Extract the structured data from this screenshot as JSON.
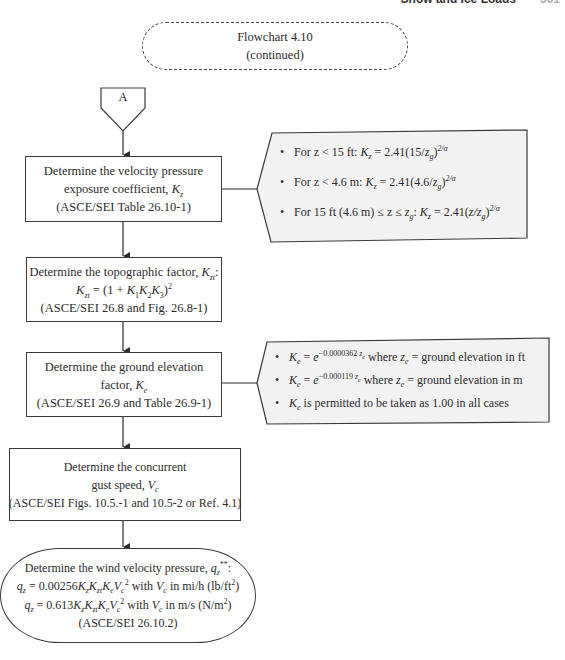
{
  "page_header": {
    "title": "Snow and Ice Loads",
    "page": "301"
  },
  "title_box": {
    "line1": "Flowchart 4.10",
    "line2": "(continued)"
  },
  "connector": {
    "label": "A"
  },
  "steps": [
    {
      "line1": "Determine the velocity pressure",
      "line2_prefix": "exposure coefficient, ",
      "line2_sym": "K",
      "line2_sub": "z",
      "line3": "(ASCE/SEI Table 26.10-1)"
    },
    {
      "line1_prefix": "Determine the topographic factor, ",
      "line1_sym": "K",
      "line1_sub": "zt",
      "line1_suffix": ":",
      "formula": "K_zt = (1 + K_1 K_2 K_3)^2",
      "line3": "(ASCE/SEI 26.8 and Fig. 26.8-1)"
    },
    {
      "line1": "Determine the ground elevation",
      "line2_prefix": "factor, ",
      "line2_sym": "K",
      "line2_sub": "e",
      "line3": "(ASCE/SEI 26.9 and Table 26.9-1)"
    },
    {
      "line1": "Determine the concurrent",
      "line2_prefix": "gust speed, ",
      "line2_sym": "V",
      "line2_sub": "c",
      "line3": "(ASCE/SEI Figs. 10.5.-1 and 10.5-2 or Ref. 4.1)"
    }
  ],
  "terminal": {
    "line1_prefix": "Determine the wind velocity pressure, ",
    "line1_sym": "q",
    "line1_sub": "z",
    "line1_sup": "**",
    "line1_suffix": ":",
    "formula_us": "q_z = 0.00256 K_z K_zt K_e V_c^2 with V_c in mi/h (lb/ft^2)",
    "formula_si": "q_z = 0.613 K_z K_zt K_e V_c^2 with V_c in m/s (N/m^2)",
    "us_coef": "0.00256",
    "si_coef": "0.613",
    "us_units": "in mi/h (lb/ft",
    "si_units": "in m/s (N/m",
    "reference": "(ASCE/SEI 26.10.2)"
  },
  "annotations": {
    "kz": {
      "items": [
        {
          "prefix": "For z < 15 ft: ",
          "formula": "K_z = 2.41(15/z_g)^(2/α)",
          "coef": "2.41",
          "inner": "15/"
        },
        {
          "prefix": "For z < 4.6 m: ",
          "formula": "K_z = 2.41(4.6/z_g)^(2/α)",
          "coef": "2.41",
          "inner": "4.6/"
        },
        {
          "prefix": "For 15 ft (4.6 m) ≤ z ≤ ",
          "formula": "K_z = 2.41(z/z_g)^(2/α)",
          "coef": "2.41",
          "inner": "z/"
        }
      ],
      "exponent": "2/α"
    },
    "ke": {
      "items": [
        {
          "formula": "K_e = e^(−0.0000362 z_e)",
          "exp_coef": "−0.0000362",
          "text": " where ",
          "suffix": " = ground elevation in ft"
        },
        {
          "formula": "K_e = e^(−0.000119 z_e)",
          "exp_coef": "−0.000119",
          "text": " where ",
          "suffix": " = ground elevation in m"
        },
        {
          "text": " is permitted to be taken as 1.00 in all cases"
        }
      ]
    }
  },
  "colors": {
    "line": "#3a3a3a",
    "annotation_fill": "#f2f2f2",
    "text": "#2b2b2b"
  }
}
